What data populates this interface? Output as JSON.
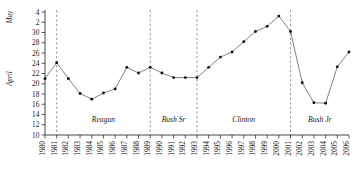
{
  "chart_data": {
    "type": "line",
    "title": "",
    "subtitle": "",
    "xlabel": "",
    "ylabel_upper": "May",
    "ylabel_lower": "April",
    "grid": false,
    "legend_position": "none",
    "xlim": [
      1980,
      2006
    ],
    "ylim_axis_units": [
      10,
      34
    ],
    "y_axis_note": "Calendar date axis: April 10 through April 30, then May 2 and May 4 (plotted as April 32 and April 34)",
    "ytick_labels": [
      "10",
      "12",
      "14",
      "16",
      "18",
      "20",
      "22",
      "24",
      "26",
      "28",
      "30",
      "2",
      "4"
    ],
    "ytick_values": [
      10,
      12,
      14,
      16,
      18,
      20,
      22,
      24,
      26,
      28,
      30,
      32,
      34
    ],
    "categories": [
      "1980",
      "1981",
      "1982",
      "1983",
      "1984",
      "1985",
      "1986",
      "1987",
      "1988",
      "1989",
      "1990",
      "1991",
      "1992",
      "1993",
      "1994",
      "1995",
      "1996",
      "1997",
      "1998",
      "1999",
      "2000",
      "2001",
      "2002",
      "2003",
      "2004",
      "2005",
      "2006"
    ],
    "x": [
      1980,
      1981,
      1982,
      1983,
      1984,
      1985,
      1986,
      1987,
      1988,
      1989,
      1990,
      1991,
      1992,
      1993,
      1994,
      1995,
      1996,
      1997,
      1998,
      1999,
      2000,
      2001,
      2002,
      2003,
      2004,
      2005,
      2006
    ],
    "values": [
      21.0,
      24.1,
      21.0,
      18.1,
      17.0,
      18.2,
      19.0,
      23.2,
      22.1,
      23.2,
      22.1,
      21.2,
      21.2,
      21.2,
      23.2,
      25.2,
      26.2,
      28.2,
      30.2,
      31.2,
      33.2,
      30.2,
      20.2,
      16.3,
      16.2,
      23.3,
      26.2
    ],
    "date_labels": [
      "Apr 21",
      "Apr 24",
      "Apr 21",
      "Apr 18",
      "Apr 17",
      "Apr 18",
      "Apr 19",
      "Apr 23",
      "Apr 22",
      "Apr 23",
      "Apr 22",
      "Apr 21",
      "Apr 21",
      "Apr 21",
      "Apr 23",
      "Apr 25",
      "Apr 26",
      "Apr 28",
      "Apr 30",
      "May 1",
      "May 3",
      "Apr 30",
      "Apr 20",
      "Apr 16",
      "Apr 16",
      "Apr 23",
      "Apr 26"
    ],
    "annotations": [
      {
        "label": "Reagan",
        "start": 1981,
        "end": 1989
      },
      {
        "label": "Bush Sr",
        "start": 1989,
        "end": 1993
      },
      {
        "label": "Clinton",
        "start": 1993,
        "end": 2001
      },
      {
        "label": "Bush Jr",
        "start": 2001,
        "end": 2006
      }
    ],
    "dividers": [
      1981,
      1989,
      1993,
      2001
    ],
    "colors": {
      "line": "#5a5a5a",
      "marker": "#111111",
      "axis": "#1a1a1a",
      "divider": "#6f6f6f",
      "background": "#ffffff"
    }
  }
}
